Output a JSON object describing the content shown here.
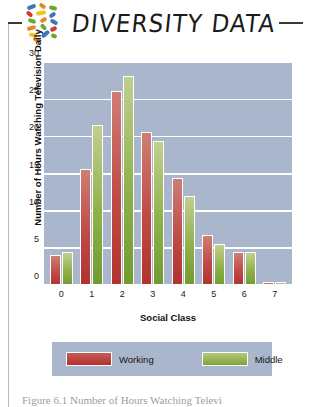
{
  "header": {
    "title": "DIVERSITY DATA",
    "logo_icon": "mosaic-chips-icon",
    "rule_left": "",
    "rule_right": ""
  },
  "chart_data": {
    "type": "bar",
    "title": "",
    "xlabel": "Social Class",
    "ylabel": "Number of Hours Watching Television Daily",
    "categories": [
      "0",
      "1",
      "2",
      "3",
      "4",
      "5",
      "6",
      "7"
    ],
    "series": [
      {
        "name": "Working",
        "color": "#b2312f",
        "values": [
          4.2,
          15.8,
          26.2,
          20.7,
          14.5,
          6.8,
          4.6,
          0.6
        ]
      },
      {
        "name": "Middle",
        "color": "#7da33a",
        "values": [
          4.6,
          21.6,
          28.2,
          19.5,
          12.1,
          5.7,
          4.6,
          0.6
        ]
      }
    ],
    "ylim": [
      0,
      30
    ],
    "yticks": [
      "0",
      "5",
      "10",
      "15",
      "20",
      "25",
      "30"
    ],
    "grid": true,
    "legend_position": "bottom",
    "plot_background": "#a9b6cb",
    "gridline_color": "#ffffff"
  },
  "caption": {
    "text": "Figure 6.1 Number of Hours Watching Televi"
  }
}
